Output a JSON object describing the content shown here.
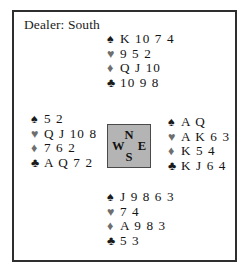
{
  "frame": {
    "dealer_label": "Dealer: South"
  },
  "suits": {
    "spade": "♠",
    "heart": "♥",
    "diamond": "♦",
    "club": "♣"
  },
  "compass": {
    "north": "N",
    "east": "E",
    "south": "S",
    "west": "W"
  },
  "hands": {
    "north": {
      "position": "North",
      "spades": "K 10 7 4",
      "hearts": "9 5 2",
      "diamonds": "Q J 10",
      "clubs": "10 9 8"
    },
    "west": {
      "position": "West",
      "spades": "5 2",
      "hearts": "Q J 10 8",
      "diamonds": "7 6 2",
      "clubs": "A Q 7 2"
    },
    "east": {
      "position": "East",
      "spades": "A Q",
      "hearts": "A K 6 3",
      "diamonds": "K 5 4",
      "clubs": "K J 6 4"
    },
    "south": {
      "position": "South",
      "spades": "J 9 8 6 3",
      "hearts": "7 4",
      "diamonds": "A 9 8 3",
      "clubs": "5 3"
    }
  },
  "colors": {
    "border": "#2e2e2e",
    "compass_fill": "#b4b4b4",
    "compass_border": "#4a4a4a",
    "text": "#111111",
    "red_suit_gray": "#6e6e6e"
  }
}
